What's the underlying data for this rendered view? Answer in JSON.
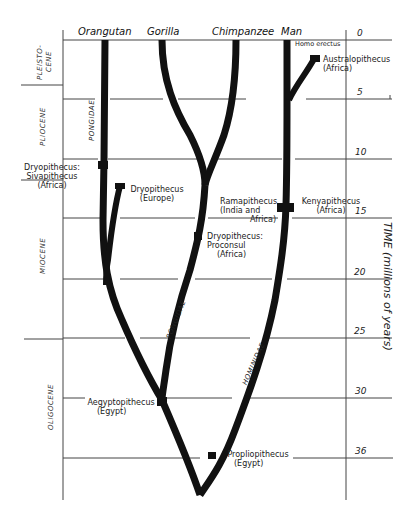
{
  "diagram": {
    "type": "phylogenetic-tree",
    "title_axis": "TIME (millions of years)",
    "columns": [
      {
        "id": "orangutan",
        "label": "Orangutan"
      },
      {
        "id": "gorilla",
        "label": "Gorilla"
      },
      {
        "id": "chimpanzee",
        "label": "Chimpanzee"
      },
      {
        "id": "man",
        "label": "Man"
      }
    ],
    "time_ticks": [
      "0",
      "5",
      "10",
      "15",
      "20",
      "25",
      "30",
      "36"
    ],
    "epochs": [
      {
        "line1": "PLEISTO-",
        "line2": "CENE"
      },
      {
        "line1": "PLIOCENE"
      },
      {
        "line1": "MIOCENE"
      },
      {
        "line1": "OLIGOCENE"
      }
    ],
    "families": {
      "pongidae_upper": "PONGIDAE",
      "pongidae_lower": "PONGIDAE",
      "hominidae": "HOMINIDAE"
    },
    "fossils": {
      "homo_erectus": "Homo erectus",
      "australopithecus": {
        "name": "Australopithecus",
        "place": "(Africa)"
      },
      "sivapithecus": {
        "name1": "Dryopithecus:",
        "name2": "Sivapithecus",
        "place": "(Africa)"
      },
      "dryopithecus_europe": {
        "name": "Dryopithecus",
        "place": "(Europe)"
      },
      "ramapithecus": {
        "name": "Ramapithecus",
        "place1": "(India and",
        "place2": "Africa)"
      },
      "kenyapithecus": {
        "name": "Kenyapithecus",
        "place": "(Africa)"
      },
      "proconsul": {
        "name1": "Dryopithecus:",
        "name2": "Proconsul",
        "place": "(Africa)"
      },
      "aegyptopithecus": {
        "name": "Aegyptopithecus",
        "place": "(Egypt)"
      },
      "propliopithecus": {
        "name": "Propliopithecus",
        "place": "(Egypt)"
      }
    },
    "colors": {
      "ink": "#111111",
      "grid": "#555555",
      "paper": "#ffffff"
    }
  }
}
